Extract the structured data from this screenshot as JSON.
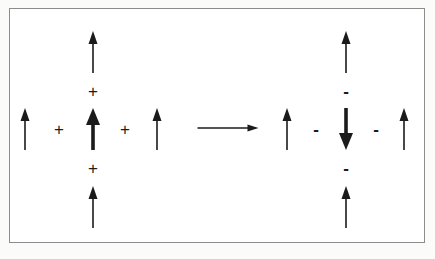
{
  "figure": {
    "background_color": "#ffffff",
    "frame_color": "#8d8d8d",
    "ink_color": "#1b1b1b",
    "width": 435,
    "height": 259
  },
  "operators": {
    "plus": "+",
    "minus": "-",
    "reaction_arrow": "→"
  },
  "left_side": {
    "label": "reactant configuration",
    "arrows": [
      {
        "name": "left-outer-up-arrow",
        "direction": "up",
        "weight": "thin",
        "x": 25,
        "y_top": 108,
        "y_bottom": 150,
        "shaft": 1.6,
        "head_w": 9,
        "head_h": 13
      },
      {
        "name": "left-center-top-up-arrow",
        "direction": "up",
        "weight": "thin",
        "x": 93,
        "y_top": 31,
        "y_bottom": 73,
        "shaft": 1.6,
        "head_w": 9,
        "head_h": 13
      },
      {
        "name": "left-center-main-up-arrow",
        "direction": "up",
        "weight": "thick",
        "x": 93,
        "y_top": 108,
        "y_bottom": 150,
        "shaft": 3.6,
        "head_w": 14,
        "head_h": 17
      },
      {
        "name": "left-center-bottom-up-arrow",
        "direction": "up",
        "weight": "thin",
        "x": 93,
        "y_top": 186,
        "y_bottom": 228,
        "shaft": 1.6,
        "head_w": 9,
        "head_h": 13
      },
      {
        "name": "left-inner-up-arrow",
        "direction": "up",
        "weight": "thin",
        "x": 157,
        "y_top": 108,
        "y_bottom": 150,
        "shaft": 1.6,
        "head_w": 9,
        "head_h": 13
      }
    ],
    "signs": [
      {
        "name": "plus-sign-1",
        "glyph": "+",
        "x": 59,
        "y": 129
      },
      {
        "name": "plus-sign-2",
        "glyph": "+",
        "x": 125,
        "y": 129
      },
      {
        "name": "plus-sign-3",
        "glyph": "+",
        "x": 93,
        "y": 91
      },
      {
        "name": "plus-sign-4",
        "glyph": "+",
        "x": 93,
        "y": 168
      }
    ]
  },
  "reaction": {
    "name": "reaction-arrow",
    "x_start": 197,
    "x_end": 258,
    "y": 128,
    "shaft": 1.4,
    "head_w": 11,
    "head_h": 7
  },
  "right_side": {
    "label": "product configuration",
    "arrows": [
      {
        "name": "right-outer-up-arrow",
        "direction": "up",
        "weight": "thin",
        "x": 287,
        "y_top": 108,
        "y_bottom": 150,
        "shaft": 1.6,
        "head_w": 9,
        "head_h": 13
      },
      {
        "name": "right-center-top-up-arrow",
        "direction": "up",
        "weight": "thin",
        "x": 346,
        "y_top": 31,
        "y_bottom": 73,
        "shaft": 1.6,
        "head_w": 9,
        "head_h": 13
      },
      {
        "name": "right-center-main-down-arrow",
        "direction": "down",
        "weight": "thick",
        "x": 346,
        "y_top": 108,
        "y_bottom": 150,
        "shaft": 3.6,
        "head_w": 14,
        "head_h": 17
      },
      {
        "name": "right-center-bottom-up-arrow",
        "direction": "up",
        "weight": "thin",
        "x": 346,
        "y_top": 186,
        "y_bottom": 228,
        "shaft": 1.6,
        "head_w": 9,
        "head_h": 13
      },
      {
        "name": "right-inner-up-arrow",
        "direction": "up",
        "weight": "thin",
        "x": 404,
        "y_top": 108,
        "y_bottom": 150,
        "shaft": 1.6,
        "head_w": 9,
        "head_h": 13
      }
    ],
    "signs": [
      {
        "name": "minus-sign-1",
        "glyph": "-",
        "x": 316,
        "y": 129
      },
      {
        "name": "minus-sign-2",
        "glyph": "-",
        "x": 376,
        "y": 129
      },
      {
        "name": "minus-sign-3",
        "glyph": "-",
        "x": 346,
        "y": 91
      },
      {
        "name": "minus-sign-4",
        "glyph": "-",
        "x": 346,
        "y": 168
      }
    ]
  }
}
